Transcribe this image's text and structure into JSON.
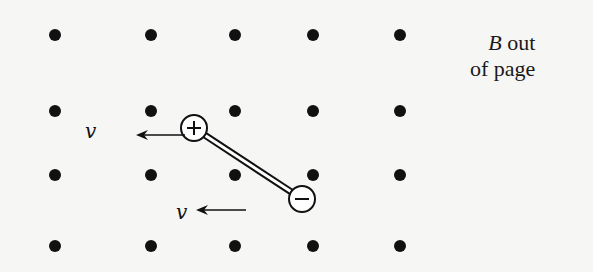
{
  "diagram": {
    "field_label": {
      "symbol": "B",
      "line1_rest": " out",
      "line2": "of page"
    },
    "field_direction": "out-of-page",
    "dot_grid": {
      "columns_x": [
        55,
        151,
        235,
        313,
        400
      ],
      "rows_y": [
        35,
        111,
        175,
        246
      ],
      "dot_radius": 6
    },
    "dipole": {
      "positive_charge": {
        "label": "+",
        "x": 194,
        "y": 128,
        "r": 13
      },
      "negative_charge": {
        "label": "−",
        "x": 302,
        "y": 199,
        "r": 13
      },
      "rod": "double-line insulating rod"
    },
    "velocity_arrows": [
      {
        "label": "v",
        "label_x": 85,
        "label_y": 138,
        "x_from": 185,
        "x_to": 136,
        "y": 135
      },
      {
        "label": "v",
        "label_x": 176,
        "label_y": 219,
        "x_from": 246,
        "x_to": 196,
        "y": 210
      }
    ],
    "colors": {
      "ink": "#111111",
      "background": "#f6f6f4"
    }
  }
}
